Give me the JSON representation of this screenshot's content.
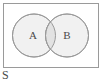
{
  "figure": {
    "type": "venn-diagram",
    "width": 107,
    "height": 83,
    "background_color": "#ffffff"
  },
  "universe": {
    "label": "S",
    "label_x": 2,
    "label_y": 79,
    "rect": {
      "x": 3.5,
      "y": 3.5,
      "width": 95,
      "height": 64
    },
    "border_color": "#9a9a9a",
    "border_width": 1,
    "fill_color": "#ffffff"
  },
  "sets": [
    {
      "label": "A",
      "cx": 34,
      "cy": 35.5,
      "r": 21.5,
      "label_x": 33,
      "label_y": 36,
      "fill_color": "#f1f1f1",
      "stroke_color": "#9a9a9a"
    },
    {
      "label": "B",
      "cx": 67,
      "cy": 35.5,
      "r": 21.5,
      "label_x": 67,
      "label_y": 36,
      "fill_color": "#f1f1f1",
      "stroke_color": "#9a9a9a"
    }
  ],
  "intersection": {
    "fill_color": "#e2e2e2",
    "stroke_color": "#9a9a9a"
  }
}
